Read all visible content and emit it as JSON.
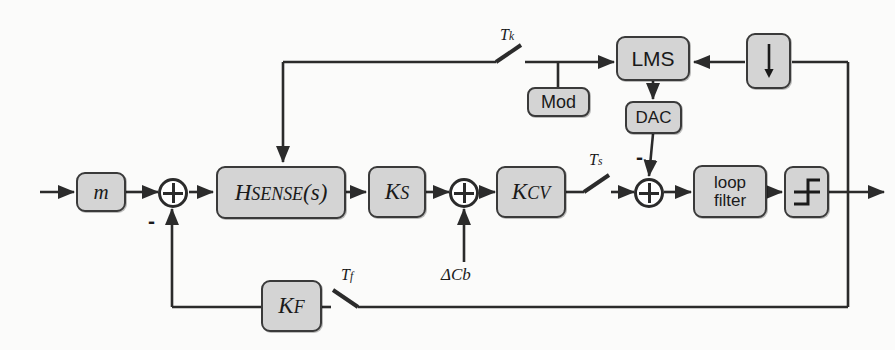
{
  "diagram": {
    "background_color": "#fbfbfa",
    "block_fill": "#d4d4d4",
    "line_color": "#2b2b2b"
  },
  "blocks": {
    "mass": {
      "label": "m",
      "name": "mass-block"
    },
    "hsense": {
      "label_main": "H",
      "label_sub": "SENSE",
      "label_arg": "(s)",
      "name": "hsense-block"
    },
    "ks": {
      "label_main": "K",
      "label_sub": "S",
      "name": "ks-block"
    },
    "kcv": {
      "label_main": "K",
      "label_sub": "CV",
      "name": "kcv-block"
    },
    "loopfilter": {
      "line1": "loop",
      "line2": "filter",
      "name": "loop-filter-block"
    },
    "quantizer": {
      "label": "quantizer",
      "name": "quantizer-block"
    },
    "downsampler": {
      "label": "downsample",
      "name": "downsampler-block"
    },
    "lms": {
      "label": "LMS",
      "name": "lms-block"
    },
    "mod": {
      "label": "Mod",
      "name": "mod-block"
    },
    "dac": {
      "label": "DAC",
      "name": "dac-block"
    },
    "kf": {
      "label_main": "K",
      "label_sub": "F",
      "name": "kf-block"
    }
  },
  "switches": {
    "tk": {
      "label_main": "T",
      "label_sub": "k",
      "name": "switch-tk"
    },
    "ts": {
      "label_main": "T",
      "label_sub": "s",
      "name": "switch-ts"
    },
    "tf": {
      "label_main": "T",
      "label_sub": "f",
      "name": "switch-tf"
    }
  },
  "signals": {
    "delta_cb": "ΔCb",
    "minus_feedback": "-",
    "minus_dac": "-"
  },
  "nodes": {
    "sum_input": "summing-junction-input",
    "sum_cb": "summing-junction-delta-cb",
    "sum_dac": "summing-junction-dac"
  }
}
